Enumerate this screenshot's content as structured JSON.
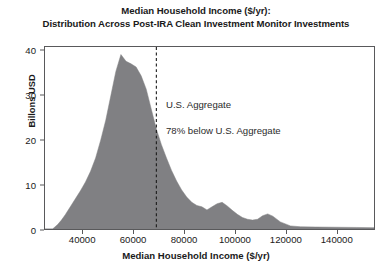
{
  "chart_data": {
    "type": "area",
    "title": "Median Household Income ($/yr):",
    "subtitle": "Distribution Across Post-IRA Clean Investment Monitor Investments",
    "xlabel": "Median Household Income ($/yr)",
    "ylabel": "Billons USD",
    "xlim": [
      25000,
      155000
    ],
    "ylim": [
      0,
      41
    ],
    "xticks": [
      40000,
      60000,
      80000,
      100000,
      120000,
      140000
    ],
    "xtick_labels": [
      "40000",
      "60000",
      "80000",
      "100000",
      "120000",
      "140000"
    ],
    "yticks": [
      0,
      10,
      20,
      30,
      40
    ],
    "ytick_labels": [
      "0",
      "10",
      "20",
      "30",
      "40"
    ],
    "grid": false,
    "legend": null,
    "series_name": "Investment density",
    "fill_color": "#808083",
    "x": [
      25000,
      28000,
      30000,
      31500,
      33000,
      35000,
      37000,
      39000,
      41000,
      43000,
      45000,
      47000,
      49000,
      51000,
      53000,
      55000,
      57000,
      59000,
      61000,
      63000,
      65000,
      67000,
      69000,
      71000,
      73000,
      75000,
      77000,
      79000,
      81000,
      83000,
      85000,
      87000,
      89000,
      91000,
      93000,
      95000,
      97000,
      99000,
      101000,
      103000,
      105000,
      107000,
      109000,
      111000,
      113000,
      115000,
      118000,
      122000,
      126000,
      132000,
      140000,
      148000,
      155000
    ],
    "y": [
      0,
      0,
      1.0,
      2.0,
      3.2,
      5.0,
      6.8,
      8.6,
      10.6,
      13.0,
      16.0,
      20.0,
      24.5,
      30.0,
      35.5,
      39.3,
      37.8,
      37.2,
      36.5,
      34.5,
      31.5,
      27.0,
      22.5,
      19.0,
      16.0,
      13.2,
      10.8,
      8.8,
      7.2,
      6.0,
      5.3,
      5.0,
      4.3,
      5.0,
      5.7,
      6.0,
      5.2,
      4.2,
      3.3,
      2.6,
      2.2,
      2.0,
      2.2,
      3.0,
      3.4,
      2.9,
      1.6,
      0.7,
      0.5,
      0.45,
      0.4,
      0.35,
      0.3
    ],
    "vline": {
      "x": 69000,
      "style": "dashed",
      "color": "#1a1a1a"
    },
    "annotations": [
      {
        "text": "U.S. Aggregate",
        "x": 72000,
        "y": 26
      },
      {
        "text": "78% below U.S. Aggregate",
        "x": 72000,
        "y": 21
      }
    ]
  },
  "chart": {
    "title_line1": "Median Household Income ($/yr):",
    "title_line2": "Distribution Across Post-IRA Clean Investment Monitor Investments",
    "xlabel": "Median Household Income ($/yr)",
    "ylabel": "Billons USD",
    "annotation_aggregate": "U.S. Aggregate",
    "annotation_below": "78% below U.S. Aggregate"
  }
}
